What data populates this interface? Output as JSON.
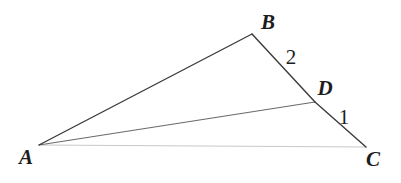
{
  "figure": {
    "background_color": "#ffffff",
    "width": 401,
    "height": 183,
    "points": {
      "A": {
        "x": 39,
        "y": 145
      },
      "B": {
        "x": 252,
        "y": 34
      },
      "C": {
        "x": 366,
        "y": 147
      },
      "D": {
        "x": 315,
        "y": 102
      }
    },
    "segments": [
      {
        "name": "AB",
        "from": "A",
        "to": "B",
        "color": "#3b3b3b",
        "width": 1.4
      },
      {
        "name": "BD",
        "from": "B",
        "to": "D",
        "color": "#3b3b3b",
        "width": 1.4
      },
      {
        "name": "DC",
        "from": "D",
        "to": "C",
        "color": "#3b3b3b",
        "width": 1.4
      },
      {
        "name": "AD",
        "from": "A",
        "to": "D",
        "color": "#6a6a6a",
        "width": 1.2
      },
      {
        "name": "AC",
        "from": "A",
        "to": "C",
        "color": "#c9c9c9",
        "width": 1.2
      }
    ],
    "labels": {
      "A": {
        "text": "A",
        "x": 26,
        "y": 157
      },
      "B": {
        "text": "B",
        "x": 268,
        "y": 22
      },
      "C": {
        "text": "C",
        "x": 373,
        "y": 159
      },
      "D": {
        "text": "D",
        "x": 325,
        "y": 88
      },
      "angle_2": {
        "text": "2",
        "x": 291,
        "y": 57
      },
      "angle_1": {
        "text": "1",
        "x": 344,
        "y": 117
      }
    }
  }
}
